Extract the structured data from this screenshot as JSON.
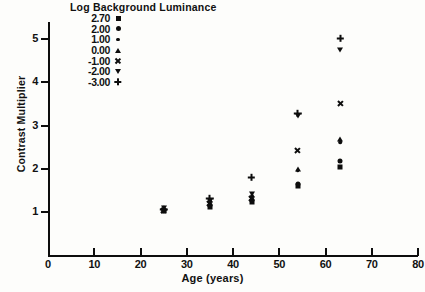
{
  "chart_data": {
    "type": "scatter",
    "title": "",
    "xlabel": "Age (years)",
    "ylabel": "Contrast Multiplier",
    "xlim": [
      0,
      80
    ],
    "ylim": [
      0,
      5.4
    ],
    "xticks": [
      0,
      10,
      20,
      30,
      40,
      50,
      60,
      70,
      80
    ],
    "xtick_labels": [
      "0",
      "10",
      "20",
      "30",
      "40",
      "50",
      "60",
      "70",
      "80"
    ],
    "yticks": [
      1,
      2,
      3,
      4,
      5
    ],
    "ytick_labels": [
      "1",
      "2",
      "3",
      "4",
      "5"
    ],
    "grid": false,
    "legend_position": "top-left",
    "legend_title": "Log Background Luminance",
    "series": [
      {
        "name": "2.70",
        "marker": "square",
        "points": [
          {
            "x": 25.0,
            "y": 1.02
          },
          {
            "x": 35.0,
            "y": 1.12
          },
          {
            "x": 44.0,
            "y": 1.22
          },
          {
            "x": 54.0,
            "y": 1.6
          },
          {
            "x": 63.2,
            "y": 2.05
          }
        ]
      },
      {
        "name": "2.00",
        "marker": "circle",
        "points": [
          {
            "x": 25.0,
            "y": 1.05
          },
          {
            "x": 35.0,
            "y": 1.16
          },
          {
            "x": 44.0,
            "y": 1.27
          },
          {
            "x": 54.0,
            "y": 1.64
          },
          {
            "x": 63.2,
            "y": 2.18
          }
        ]
      },
      {
        "name": "1.00",
        "marker": "dot",
        "points": [
          {
            "x": 25.0,
            "y": 1.0
          },
          {
            "x": 35.0,
            "y": 1.22
          },
          {
            "x": 44.0,
            "y": 1.33
          },
          {
            "x": 54.0,
            "y": 1.95
          },
          {
            "x": 63.2,
            "y": 2.62
          }
        ]
      },
      {
        "name": "0.00",
        "marker": "triangle-up",
        "points": [
          {
            "x": 25.0,
            "y": 1.08
          },
          {
            "x": 35.0,
            "y": 1.28
          },
          {
            "x": 44.0,
            "y": 1.38
          },
          {
            "x": 54.0,
            "y": 2.0
          },
          {
            "x": 63.2,
            "y": 2.68
          }
        ]
      },
      {
        "name": "-1.00",
        "marker": "cross",
        "points": [
          {
            "x": 25.0,
            "y": 1.04
          },
          {
            "x": 35.0,
            "y": 1.2
          },
          {
            "x": 44.0,
            "y": 1.3
          },
          {
            "x": 54.0,
            "y": 2.42
          },
          {
            "x": 63.2,
            "y": 3.52
          }
        ]
      },
      {
        "name": "-2.00",
        "marker": "triangle-down",
        "points": [
          {
            "x": 25.0,
            "y": 1.1
          },
          {
            "x": 35.0,
            "y": 1.25
          },
          {
            "x": 44.0,
            "y": 1.42
          },
          {
            "x": 54.0,
            "y": 3.22
          },
          {
            "x": 63.2,
            "y": 4.74
          }
        ]
      },
      {
        "name": "-3.00",
        "marker": "plus",
        "points": [
          {
            "x": 25.0,
            "y": 1.06
          },
          {
            "x": 35.0,
            "y": 1.3
          },
          {
            "x": 44.0,
            "y": 1.8
          },
          {
            "x": 54.0,
            "y": 3.28
          },
          {
            "x": 63.2,
            "y": 5.02
          }
        ]
      }
    ]
  }
}
